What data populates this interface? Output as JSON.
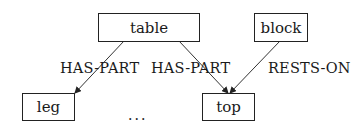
{
  "diagram": {
    "type": "semantic-network",
    "nodes": [
      {
        "id": "table",
        "label": "table"
      },
      {
        "id": "block",
        "label": "block"
      },
      {
        "id": "leg",
        "label": "leg"
      },
      {
        "id": "top",
        "label": "top"
      }
    ],
    "edges": [
      {
        "from": "table",
        "to": "leg",
        "label": "HAS-PART"
      },
      {
        "from": "table",
        "to": "top",
        "label": "HAS-PART"
      },
      {
        "from": "block",
        "to": "top",
        "label": "RESTS-ON"
      }
    ],
    "ellipsis": "..."
  }
}
